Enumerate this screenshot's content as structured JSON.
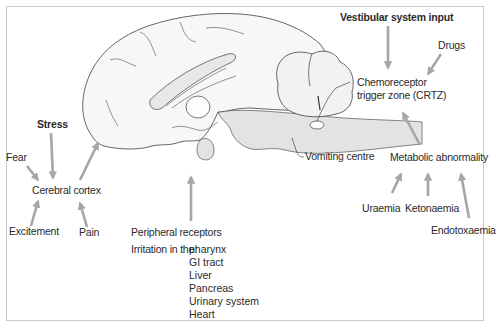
{
  "diagram": {
    "type": "labeled anatomical flow diagram (brain sagittal section, vomiting pathways)",
    "colors": {
      "arrow": "#a6a6a6",
      "outline": "#555555",
      "shaded_region": "#e3e3e3",
      "frame": "#c9c9c9"
    },
    "labels": {
      "stress": "Stress",
      "fear": "Fear",
      "cerebral_cortex": "Cerebral cortex",
      "excitement": "Excitement",
      "pain": "Pain",
      "peripheral_receptors": "Peripheral receptors",
      "irritation_prefix": "Irritation in the:",
      "vestibular": "Vestibular system input",
      "drugs": "Drugs",
      "crtz_line1": "Chemoreceptor",
      "crtz_line2": "trigger zone (CRTZ)",
      "vomiting_centre": "Vomiting centre",
      "metabolic": "Metabolic abnormality",
      "uraemia": "Uraemia",
      "ketonaemia": "Ketonaemia",
      "endotoxaemia": "Endotoxaemia"
    },
    "irritation_sites": [
      "pharynx",
      "GI tract",
      "Liver",
      "Pancreas",
      "Urinary system",
      "Heart"
    ],
    "edges": [
      {
        "from": "Stress",
        "to": "Cerebral cortex"
      },
      {
        "from": "Fear",
        "to": "Cerebral cortex"
      },
      {
        "from": "Excitement",
        "to": "Cerebral cortex"
      },
      {
        "from": "Pain",
        "to": "Cerebral cortex"
      },
      {
        "from": "Cerebral cortex",
        "to": "Brain (vomiting centre)"
      },
      {
        "from": "Peripheral receptors",
        "to": "Vomiting centre"
      },
      {
        "from": "Vestibular system input",
        "to": "Chemoreceptor trigger zone (CRTZ)"
      },
      {
        "from": "Drugs",
        "to": "Chemoreceptor trigger zone (CRTZ)"
      },
      {
        "from": "Metabolic abnormality",
        "to": "Chemoreceptor trigger zone (CRTZ)"
      },
      {
        "from": "Uraemia",
        "to": "Metabolic abnormality"
      },
      {
        "from": "Ketonaemia",
        "to": "Metabolic abnormality"
      },
      {
        "from": "Endotoxaemia",
        "to": "Metabolic abnormality"
      }
    ]
  }
}
